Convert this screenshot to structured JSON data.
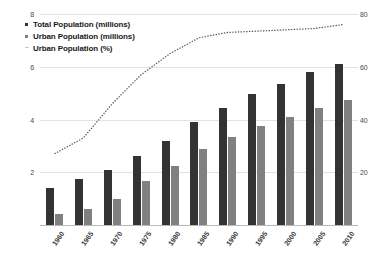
{
  "chart_data": {
    "type": "bar",
    "title": "",
    "xlabel": "",
    "ylabel": "",
    "categories": [
      "1960",
      "1965",
      "1970",
      "1975",
      "1980",
      "1985",
      "1990",
      "1995",
      "2000",
      "2005",
      "2010"
    ],
    "series": [
      {
        "name": "Total Population (millions)",
        "type": "bar",
        "axis": "left",
        "color": "#333333",
        "values": [
          1.4,
          1.75,
          2.1,
          2.6,
          3.2,
          3.9,
          4.45,
          4.95,
          5.35,
          5.8,
          6.1
        ]
      },
      {
        "name": "Urban Population (millions)",
        "type": "bar",
        "axis": "left",
        "color": "#808080",
        "values": [
          0.4,
          0.6,
          1.0,
          1.65,
          2.25,
          2.9,
          3.35,
          3.75,
          4.1,
          4.45,
          4.75
        ]
      },
      {
        "name": "Urban Population (%)",
        "type": "line",
        "axis": "right",
        "color": "#555555",
        "style": "dotted",
        "values": [
          27,
          33,
          46,
          57,
          65,
          71,
          73,
          73.5,
          74,
          74.5,
          76
        ]
      }
    ],
    "ylim": [
      0,
      8
    ],
    "y2lim": [
      0,
      80
    ],
    "yticks_left": [
      "8",
      "6",
      "4",
      "2"
    ],
    "yticks_right": [
      "80",
      "60",
      "40",
      "20"
    ],
    "grid": true,
    "legend_position": "top-left"
  },
  "legend": {
    "items": [
      {
        "label": "Total Population (millions)",
        "marker": "square",
        "color": "#333333"
      },
      {
        "label": "Urban Population (millions)",
        "marker": "square",
        "color": "#808080"
      },
      {
        "label": "Urban Population (%)",
        "marker": "dotted-line",
        "color": "#555555"
      }
    ]
  }
}
